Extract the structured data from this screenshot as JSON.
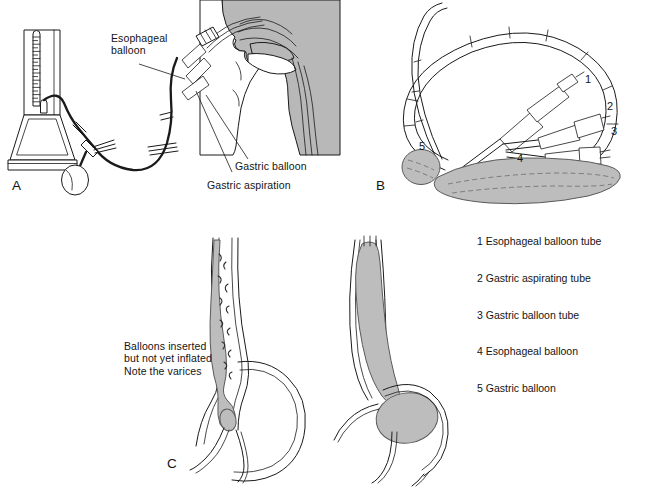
{
  "figure": {
    "background_color": "#ffffff",
    "ink_color": "#1a1a1a",
    "tissue_gray": "#b8b8b8",
    "balloon_gray": "#bdbdbd",
    "light_gray": "#d9d9d9"
  },
  "panels": {
    "a": {
      "label": "A",
      "callouts": [
        {
          "id": "esophageal-balloon",
          "text": "Esophageal\nballoon"
        },
        {
          "id": "gastric-balloon",
          "text": "Gastric balloon"
        },
        {
          "id": "gastric-aspiration",
          "text": "Gastric aspiration"
        }
      ]
    },
    "b": {
      "label": "B",
      "numbers": [
        "1",
        "2",
        "3",
        "4",
        "5"
      ],
      "legend": [
        {
          "num": "1",
          "text": "Esophageal balloon tube"
        },
        {
          "num": "2",
          "text": "Gastric aspirating tube"
        },
        {
          "num": "3",
          "text": "Gastric balloon tube"
        },
        {
          "num": "4",
          "text": "Esophageal balloon"
        },
        {
          "num": "5",
          "text": "Gastric balloon"
        }
      ]
    },
    "c": {
      "label": "C",
      "caption": "Balloons inserted\nbut not yet inflated\nNote the varices"
    }
  }
}
